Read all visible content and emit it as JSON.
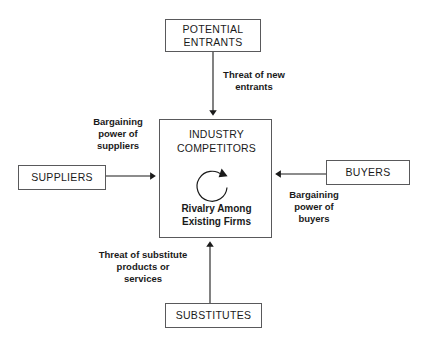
{
  "diagram": {
    "background_color": "#ffffff",
    "line_color": "#59595b",
    "text_color": "#1a1a1a",
    "nodes": {
      "potential_entrants": "POTENTIAL\nENTRANTS",
      "potential_entrants_line1": "POTENTIAL",
      "potential_entrants_line2": "ENTRANTS",
      "suppliers": "SUPPLIERS",
      "buyers": "BUYERS",
      "substitutes": "SUBSTITUTES",
      "industry_competitors_line1": "INDUSTRY",
      "industry_competitors_line2": "COMPETITORS",
      "rivalry_line1": "Rivalry Among",
      "rivalry_line2": "Existing Firms"
    },
    "edges": {
      "threat_of_new_entrants": "Threat of new\nentrants",
      "bargaining_power_of_suppliers": "Bargaining\npower of\nsuppliers",
      "bargaining_power_of_buyers": "Bargaining\npower of\nbuyers",
      "threat_of_substitutes": "Threat of substitute\nproducts or\nservices"
    },
    "icons": {
      "rivalry_loop": "circular-arrow-icon"
    }
  }
}
